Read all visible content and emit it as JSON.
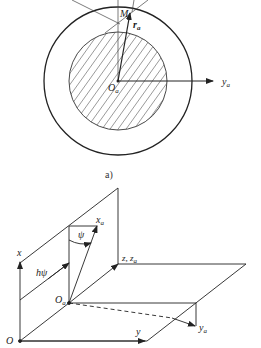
{
  "figure_a": {
    "caption": "a)",
    "labels": {
      "point_m": "M",
      "radius": "r",
      "radius_sub": "a",
      "origin": "O",
      "origin_sub": "a",
      "axis_y": "y",
      "axis_y_sub": "a"
    }
  },
  "figure_b": {
    "labels": {
      "axis_x": "x",
      "axis_xa": "x",
      "axis_xa_sub": "a",
      "angle": "ψ",
      "offset": "hψ",
      "axis_z": "z, z",
      "axis_z_sub": "a",
      "origin_a": "O",
      "origin_a_sub": "a",
      "origin": "O",
      "axis_y": "y",
      "axis_ya": "y",
      "axis_ya_sub": "a"
    }
  },
  "colors": {
    "line": "#222222",
    "background": "#ffffff"
  }
}
